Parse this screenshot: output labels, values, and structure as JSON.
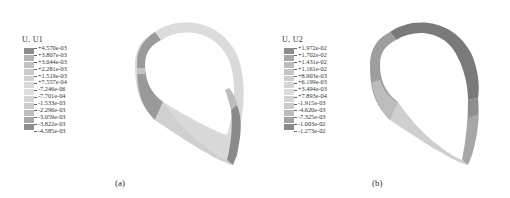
{
  "figure": {
    "panels": [
      {
        "id": "a",
        "caption": "(a)",
        "legend": {
          "title": "U, U1",
          "labels": [
            "+4.570e-03",
            "+3.807e-03",
            "+3.044e-03",
            "+2.281e-03",
            "+1.519e-03",
            "+7.557e-04",
            "-7.246e-06",
            "-7.701e-04",
            "-1.533e-03",
            "-2.296e-03",
            "-3.059e-03",
            "-3.822e-03",
            "-4.585e-03"
          ],
          "colors": [
            "#8c8c8c",
            "#b4b4b4",
            "#c2c2c2",
            "#cacaca",
            "#d2d2d2",
            "#d9d9d9",
            "#dedede",
            "#d6d6d6",
            "#cccccc",
            "#bebebe",
            "#a8a8a8",
            "#8e8e8e"
          ]
        }
      },
      {
        "id": "b",
        "caption": "(b)",
        "legend": {
          "title": "U, U2",
          "labels": [
            "+1.972e-02",
            "+1.702e-02",
            "+1.431e-02",
            "+1.161e-02",
            "+8.903e-03",
            "+6.199e-03",
            "+3.494e-03",
            "+7.893e-04",
            "-1.915e-03",
            "-4.620e-03",
            "-7.325e-03",
            "-1.003e-02",
            "-1.273e-02"
          ],
          "colors": [
            "#8c8c8c",
            "#a8a8a8",
            "#bdbdbd",
            "#c6c6c6",
            "#cecece",
            "#d6d6d6",
            "#dcdcdc",
            "#d4d4d4",
            "#cacaca",
            "#bcbcbc",
            "#a4a4a4",
            "#8a8a8a"
          ]
        }
      }
    ]
  }
}
